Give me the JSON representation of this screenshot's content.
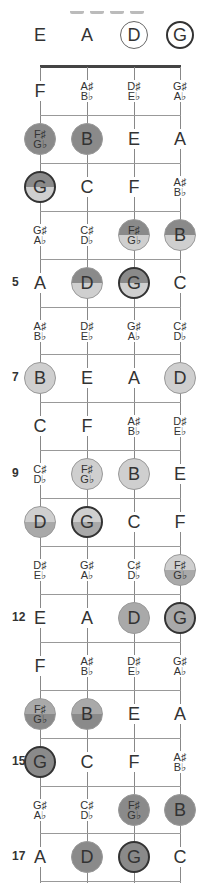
{
  "title_fragment": "G D B A",
  "strings": [
    "E",
    "A",
    "D",
    "G"
  ],
  "open_strings": [
    {
      "note": "E",
      "marker": "none"
    },
    {
      "note": "A",
      "marker": "none"
    },
    {
      "note": "D",
      "marker": "thin-ring"
    },
    {
      "note": "G",
      "marker": "thick-ring"
    }
  ],
  "fret_number_labels": [
    "5",
    "7",
    "9",
    "12",
    "15",
    "17"
  ],
  "colors": {
    "dark": "#8a8a8a",
    "medium": "#a9a9a9",
    "light": "#cfcfcf",
    "line": "#999999",
    "nut": "#444444",
    "text": "#333333"
  },
  "frets": [
    {
      "fret": 1,
      "label": "",
      "notes": [
        {
          "n": "F",
          "c": ""
        },
        {
          "n": "A♯\nB♭",
          "c": ""
        },
        {
          "n": "D♯\nE♭",
          "c": ""
        },
        {
          "n": "G♯\nA♭",
          "c": ""
        }
      ]
    },
    {
      "fret": 2,
      "label": "",
      "notes": [
        {
          "n": "F♯\nG♭",
          "c": "dark"
        },
        {
          "n": "B",
          "c": "dark"
        },
        {
          "n": "E",
          "c": ""
        },
        {
          "n": "A",
          "c": ""
        }
      ]
    },
    {
      "fret": 3,
      "label": "",
      "notes": [
        {
          "n": "G",
          "c": "dark-light",
          "ring": true
        },
        {
          "n": "C",
          "c": ""
        },
        {
          "n": "F",
          "c": ""
        },
        {
          "n": "A♯\nB♭",
          "c": ""
        }
      ]
    },
    {
      "fret": 4,
      "label": "",
      "notes": [
        {
          "n": "G♯\nA♭",
          "c": ""
        },
        {
          "n": "C♯\nD♭",
          "c": ""
        },
        {
          "n": "F♯\nG♭",
          "c": "dark-light"
        },
        {
          "n": "B",
          "c": "dark-light"
        }
      ]
    },
    {
      "fret": 5,
      "label": "5",
      "notes": [
        {
          "n": "A",
          "c": ""
        },
        {
          "n": "D",
          "c": "dark-light"
        },
        {
          "n": "G",
          "c": "dark-light",
          "ring": true
        },
        {
          "n": "C",
          "c": ""
        }
      ]
    },
    {
      "fret": 6,
      "label": "",
      "notes": [
        {
          "n": "A♯\nB♭",
          "c": ""
        },
        {
          "n": "D♯\nE♭",
          "c": ""
        },
        {
          "n": "G♯\nA♭",
          "c": ""
        },
        {
          "n": "C♯\nD♭",
          "c": ""
        }
      ]
    },
    {
      "fret": 7,
      "label": "7",
      "notes": [
        {
          "n": "B",
          "c": "light"
        },
        {
          "n": "E",
          "c": ""
        },
        {
          "n": "A",
          "c": ""
        },
        {
          "n": "D",
          "c": "light"
        }
      ]
    },
    {
      "fret": 8,
      "label": "",
      "notes": [
        {
          "n": "C",
          "c": ""
        },
        {
          "n": "F",
          "c": ""
        },
        {
          "n": "A♯\nB♭",
          "c": ""
        },
        {
          "n": "D♯\nE♭",
          "c": ""
        }
      ]
    },
    {
      "fret": 9,
      "label": "9",
      "notes": [
        {
          "n": "C♯\nD♭",
          "c": ""
        },
        {
          "n": "F♯\nG♭",
          "c": "light"
        },
        {
          "n": "B",
          "c": "light"
        },
        {
          "n": "E",
          "c": ""
        }
      ]
    },
    {
      "fret": 10,
      "label": "",
      "notes": [
        {
          "n": "D",
          "c": "light-medium"
        },
        {
          "n": "G",
          "c": "light-medium",
          "ring": true
        },
        {
          "n": "C",
          "c": ""
        },
        {
          "n": "F",
          "c": ""
        }
      ]
    },
    {
      "fret": 11,
      "label": "",
      "notes": [
        {
          "n": "D♯\nE♭",
          "c": ""
        },
        {
          "n": "G♯\nA♭",
          "c": ""
        },
        {
          "n": "C♯\nD♭",
          "c": ""
        },
        {
          "n": "F♯\nG♭",
          "c": "light-medium"
        }
      ]
    },
    {
      "fret": 12,
      "label": "12",
      "notes": [
        {
          "n": "E",
          "c": ""
        },
        {
          "n": "A",
          "c": ""
        },
        {
          "n": "D",
          "c": "medium"
        },
        {
          "n": "G",
          "c": "medium",
          "ring": true
        }
      ]
    },
    {
      "fret": 13,
      "label": "",
      "notes": [
        {
          "n": "F",
          "c": ""
        },
        {
          "n": "A♯\nB♭",
          "c": ""
        },
        {
          "n": "D♯\nE♭",
          "c": ""
        },
        {
          "n": "G♯\nA♭",
          "c": ""
        }
      ]
    },
    {
      "fret": 14,
      "label": "",
      "notes": [
        {
          "n": "F♯\nG♭",
          "c": "medium-dark"
        },
        {
          "n": "B",
          "c": "medium-dark"
        },
        {
          "n": "E",
          "c": ""
        },
        {
          "n": "A",
          "c": ""
        }
      ]
    },
    {
      "fret": 15,
      "label": "15",
      "notes": [
        {
          "n": "G",
          "c": "dark",
          "ring": true
        },
        {
          "n": "C",
          "c": ""
        },
        {
          "n": "F",
          "c": ""
        },
        {
          "n": "A♯\nB♭",
          "c": ""
        }
      ]
    },
    {
      "fret": 16,
      "label": "",
      "notes": [
        {
          "n": "G♯\nA♭",
          "c": ""
        },
        {
          "n": "C♯\nD♭",
          "c": ""
        },
        {
          "n": "F♯\nG♭",
          "c": "dark"
        },
        {
          "n": "B",
          "c": "dark"
        }
      ]
    },
    {
      "fret": 17,
      "label": "17",
      "notes": [
        {
          "n": "A",
          "c": ""
        },
        {
          "n": "D",
          "c": "dark"
        },
        {
          "n": "G",
          "c": "dark",
          "ring": true
        },
        {
          "n": "C",
          "c": ""
        }
      ]
    }
  ]
}
